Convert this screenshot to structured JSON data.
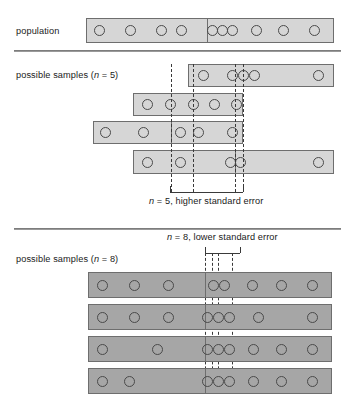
{
  "figure": {
    "title_rows": {
      "population_label": "population",
      "samples5_label": "possible samples (n = 5)",
      "samples8_label": "possible samples (n = 8)"
    },
    "annotations": {
      "n5_note": "n = 5, higher standard error",
      "n8_note": "n = 8, lower standard error"
    }
  },
  "chart_data": {
    "type": "diagram",
    "population": {
      "label": "population",
      "bar": {
        "x": 86,
        "y": 18,
        "width": 248,
        "height": 25,
        "shade": "light"
      },
      "mean_divider_x": 207,
      "circle_cx": [
        99,
        130,
        161,
        181,
        212,
        222,
        232,
        256,
        283,
        314
      ],
      "n_circles": 10
    },
    "samples_n5": {
      "label": "possible samples (n = 5)",
      "note": "n = 5, higher standard error",
      "shade": "light",
      "rows": [
        {
          "x": 188,
          "y": 64,
          "width": 146,
          "height": 23,
          "circle_cx": [
            203,
            232,
            243,
            254,
            318
          ],
          "mean_x": 243,
          "divider_x": null
        },
        {
          "x": 133,
          "y": 93,
          "width": 110,
          "height": 23,
          "circle_cx": [
            147,
            170,
            193,
            214,
            236
          ],
          "mean_x": 193,
          "divider_x": null
        },
        {
          "x": 93,
          "y": 121,
          "width": 150,
          "height": 23,
          "circle_cx": [
            105,
            143,
            180,
            198,
            232
          ],
          "mean_x": 171,
          "divider_x": 171
        },
        {
          "x": 133,
          "y": 150,
          "width": 201,
          "height": 24,
          "circle_cx": [
            147,
            180,
            230,
            240,
            318
          ],
          "mean_x": 235,
          "divider_x": 235
        }
      ],
      "mean_lines_x": [
        171,
        193,
        235,
        243
      ],
      "bracket": {
        "x1": 170,
        "x2": 243,
        "y": 192
      }
    },
    "samples_n8": {
      "label": "possible samples (n = 8)",
      "note": "n = 8, lower standard error",
      "shade": "dark",
      "rows": [
        {
          "x": 88,
          "y": 272,
          "width": 244,
          "height": 26,
          "circle_cx": [
            102,
            134,
            168,
            213,
            224,
            252,
            281,
            312
          ],
          "mean_x": 218,
          "divider_x": 205
        },
        {
          "x": 88,
          "y": 304,
          "width": 244,
          "height": 26,
          "circle_cx": [
            102,
            134,
            168,
            207,
            218,
            229,
            258,
            312
          ],
          "mean_x": 212,
          "divider_x": 205
        },
        {
          "x": 88,
          "y": 336,
          "width": 244,
          "height": 26,
          "circle_cx": [
            102,
            157,
            207,
            218,
            229,
            253,
            281,
            312
          ],
          "mean_x": 207,
          "divider_x": 205
        },
        {
          "x": 88,
          "y": 368,
          "width": 244,
          "height": 26,
          "circle_cx": [
            102,
            129,
            207,
            218,
            229,
            253,
            281,
            312
          ],
          "mean_x": 205,
          "divider_x": 205
        }
      ],
      "mean_lines_x": [
        205,
        212,
        218,
        232
      ],
      "bracket": {
        "x1": 205,
        "x2": 240,
        "y": 253
      }
    },
    "rules_y": [
      50,
      228
    ]
  }
}
